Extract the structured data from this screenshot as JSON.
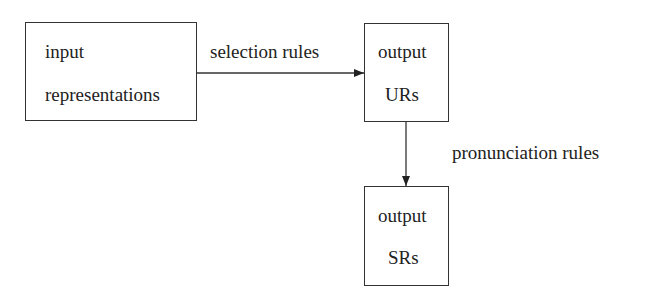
{
  "diagram": {
    "nodes": [
      {
        "id": "input",
        "lines": [
          "input",
          "representations"
        ]
      },
      {
        "id": "output_urs",
        "lines": [
          "output",
          "URs"
        ]
      },
      {
        "id": "output_srs",
        "lines": [
          "output",
          "SRs"
        ]
      }
    ],
    "edges": [
      {
        "from": "input",
        "to": "output_urs",
        "label": "selection rules"
      },
      {
        "from": "output_urs",
        "to": "output_srs",
        "label": "pronunciation rules"
      }
    ]
  }
}
